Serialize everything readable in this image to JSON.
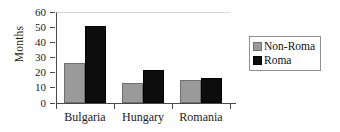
{
  "chart_data": {
    "type": "bar",
    "title": "",
    "xlabel": "",
    "ylabel": "Months",
    "categories": [
      "Bulgaria",
      "Hungary",
      "Romania"
    ],
    "series": [
      {
        "name": "Non-Roma",
        "color": "#9a9a9a",
        "values": [
          26.5,
          13,
          15
        ]
      },
      {
        "name": "Roma",
        "color": "#0d0d0d",
        "values": [
          51,
          22,
          16.5
        ]
      }
    ],
    "ylim": [
      0,
      60
    ],
    "ytick_values": [
      0,
      10,
      20,
      30,
      40,
      50,
      60
    ],
    "ytick_labels": [
      "0",
      "10",
      "20",
      "30",
      "40",
      "50",
      "60"
    ],
    "grid": false,
    "legend_position": "right"
  },
  "legend": {
    "entries": [
      {
        "label": "Non-Roma",
        "swatch": "gray-swatch-icon"
      },
      {
        "label": "Roma",
        "swatch": "black-swatch-icon"
      }
    ]
  }
}
